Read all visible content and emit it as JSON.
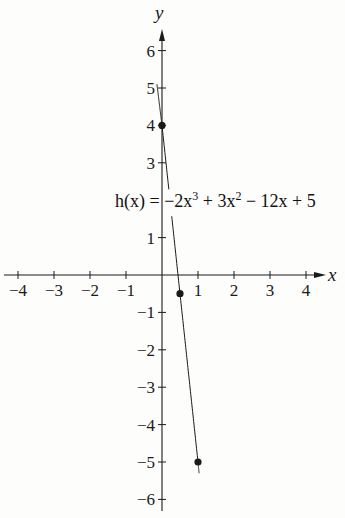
{
  "chart_data": {
    "type": "line",
    "title": "",
    "xlabel": "x",
    "ylabel": "y",
    "xlim": [
      -4.3,
      4.5
    ],
    "ylim": [
      -6.3,
      6.6
    ],
    "grid": false,
    "x_ticks": [
      -4,
      -3,
      -2,
      -1,
      1,
      2,
      3,
      4
    ],
    "x_tick_labels": [
      "−4",
      "−3",
      "−2",
      "−1",
      "1",
      "2",
      "3",
      "4"
    ],
    "y_ticks": [
      6,
      5,
      4,
      3,
      1,
      -1,
      -2,
      -3,
      -4,
      -5,
      -6
    ],
    "y_tick_labels": [
      "6",
      "5",
      "4",
      "3",
      "1",
      "−1",
      "−2",
      "−3",
      "−4",
      "−5",
      "−6"
    ],
    "annotation": {
      "text_parts": [
        "h(x) = −2x",
        "3",
        " + 3x",
        "2",
        " − 12x + 5"
      ],
      "full_text": "h(x) = −2x³ + 3x² − 12x + 5",
      "anchor": [
        0.3,
        2
      ]
    },
    "series": [
      {
        "name": "h(x)",
        "x": [
          -0.14,
          0,
          0.5,
          1,
          1.03
        ],
        "y": [
          5.1,
          4,
          -0.5,
          -5,
          -5.3
        ]
      }
    ],
    "marked_points": [
      {
        "x": 0,
        "y": 4
      },
      {
        "x": 0.5,
        "y": -0.5
      },
      {
        "x": 1,
        "y": -5
      }
    ],
    "colors": {
      "background": "#fdfdfc",
      "ink": "#1a1a1a"
    }
  }
}
